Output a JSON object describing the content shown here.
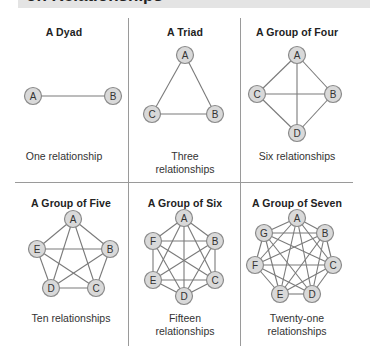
{
  "header": {
    "title": "on Relationships"
  },
  "colors": {
    "header_band": "#e4e4e4",
    "node_fill": "#d9d9d9",
    "node_stroke": "#8a8a8a",
    "edge": "#7a7a7a",
    "divider": "#9a9a9a"
  },
  "panels": [
    {
      "title": "A Dyad",
      "caption": "One relationship",
      "title_pos": [
        8,
        26
      ],
      "caption_pos": [
        8,
        150
      ],
      "nodes": [
        {
          "label": "A",
          "x": 33,
          "y": 96
        },
        {
          "label": "B",
          "x": 113,
          "y": 96
        }
      ]
    },
    {
      "title": "A Triad",
      "caption": "Three relationships",
      "title_pos": [
        129,
        26
      ],
      "caption_pos": [
        129,
        150
      ],
      "nodes": [
        {
          "label": "A",
          "x": 185,
          "y": 55
        },
        {
          "label": "B",
          "x": 215,
          "y": 114
        },
        {
          "label": "C",
          "x": 152,
          "y": 114
        }
      ]
    },
    {
      "title": "A Group of Four",
      "caption": "Six relationships",
      "title_pos": [
        241,
        26
      ],
      "caption_pos": [
        241,
        150
      ],
      "nodes": [
        {
          "label": "A",
          "x": 297,
          "y": 55
        },
        {
          "label": "B",
          "x": 333,
          "y": 94
        },
        {
          "label": "C",
          "x": 257,
          "y": 94
        },
        {
          "label": "D",
          "x": 297,
          "y": 133
        }
      ]
    },
    {
      "title": "A Group of Five",
      "caption": "Ten relationships",
      "title_pos": [
        15,
        197
      ],
      "caption_pos": [
        15,
        312
      ],
      "nodes": [
        {
          "label": "A",
          "x": 73,
          "y": 219
        },
        {
          "label": "B",
          "x": 110,
          "y": 249
        },
        {
          "label": "C",
          "x": 96,
          "y": 288
        },
        {
          "label": "D",
          "x": 51,
          "y": 288
        },
        {
          "label": "E",
          "x": 37,
          "y": 249
        }
      ]
    },
    {
      "title": "A Group of Six",
      "caption": "Fifteen relationships",
      "title_pos": [
        129,
        197
      ],
      "caption_pos": [
        129,
        312
      ],
      "nodes": [
        {
          "label": "A",
          "x": 184,
          "y": 218
        },
        {
          "label": "B",
          "x": 215,
          "y": 241
        },
        {
          "label": "C",
          "x": 215,
          "y": 280
        },
        {
          "label": "D",
          "x": 184,
          "y": 296
        },
        {
          "label": "E",
          "x": 153,
          "y": 280
        },
        {
          "label": "F",
          "x": 153,
          "y": 241
        }
      ]
    },
    {
      "title": "A Group of Seven",
      "caption": "Twenty-one relationships",
      "title_pos": [
        241,
        197
      ],
      "caption_pos": [
        241,
        312
      ],
      "nodes": [
        {
          "label": "A",
          "x": 297,
          "y": 218
        },
        {
          "label": "B",
          "x": 325,
          "y": 233
        },
        {
          "label": "C",
          "x": 333,
          "y": 265
        },
        {
          "label": "D",
          "x": 312,
          "y": 294
        },
        {
          "label": "E",
          "x": 280,
          "y": 294
        },
        {
          "label": "F",
          "x": 255,
          "y": 265
        },
        {
          "label": "G",
          "x": 264,
          "y": 233
        }
      ]
    }
  ]
}
